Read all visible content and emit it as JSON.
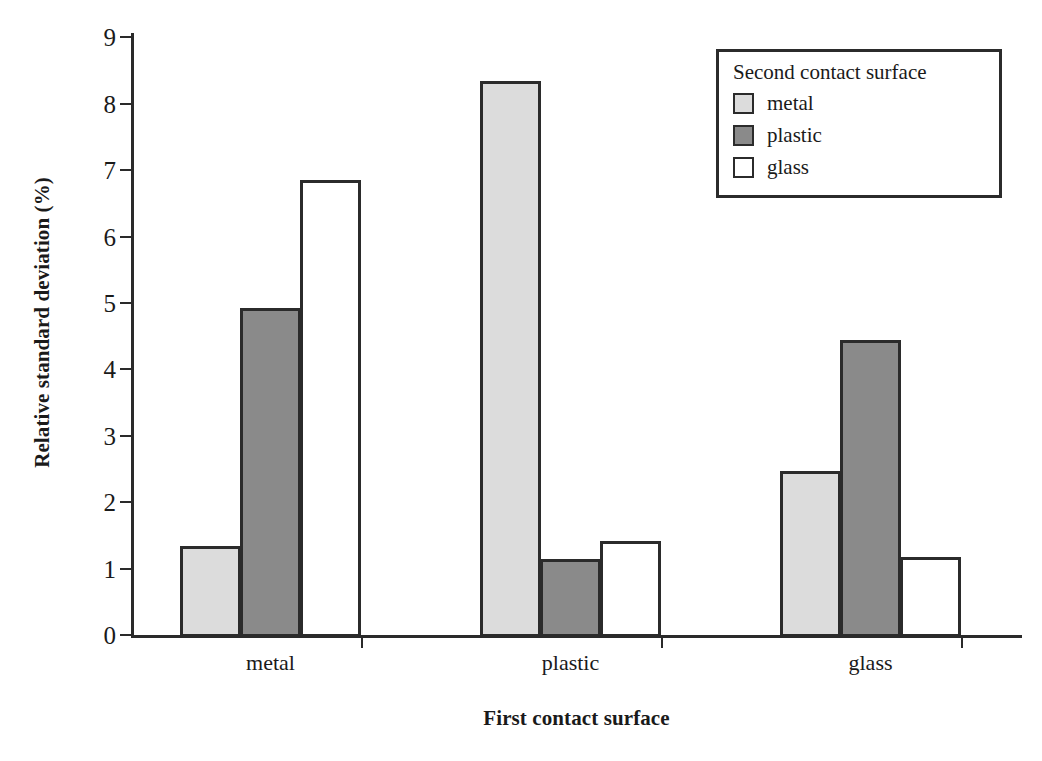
{
  "chart_data": {
    "type": "bar",
    "title": "",
    "xlabel": "First contact surface",
    "ylabel": "Relative standard deviation (%)",
    "categories": [
      "metal",
      "plastic",
      "glass"
    ],
    "series": [
      {
        "name": "metal",
        "values": [
          1.34,
          8.35,
          2.47
        ],
        "color": "#dcdcdc"
      },
      {
        "name": "plastic",
        "values": [
          4.93,
          1.14,
          4.45
        ],
        "color": "#8a8a8a"
      },
      {
        "name": "glass",
        "values": [
          6.85,
          1.42,
          1.17
        ],
        "color": "#ffffff"
      }
    ],
    "ylim": [
      0,
      9
    ],
    "ytick_labels": [
      "9",
      "8",
      "7",
      "6",
      "5",
      "4",
      "3",
      "2",
      "1",
      "0"
    ],
    "ytick_values": [
      9,
      8,
      7,
      6,
      5,
      4,
      3,
      2,
      1,
      0
    ],
    "grid": false,
    "legend_position": "top-right"
  },
  "legend": {
    "title": "Second contact surface",
    "entries": [
      {
        "label": "metal",
        "color": "#dcdcdc"
      },
      {
        "label": "plastic",
        "color": "#8a8a8a"
      },
      {
        "label": "glass",
        "color": "#ffffff"
      }
    ]
  },
  "axes": {
    "y_title": "Relative standard deviation (%)",
    "x_title": "First contact surface",
    "x_group_labels": [
      "metal",
      "plastic",
      "glass"
    ]
  },
  "colors": {
    "axis": "#2a2a2a",
    "bar_border": "#2b2b2b",
    "metal_fill": "#dcdcdc",
    "plastic_fill": "#8a8a8a",
    "glass_fill": "#ffffff",
    "background": "#ffffff"
  }
}
